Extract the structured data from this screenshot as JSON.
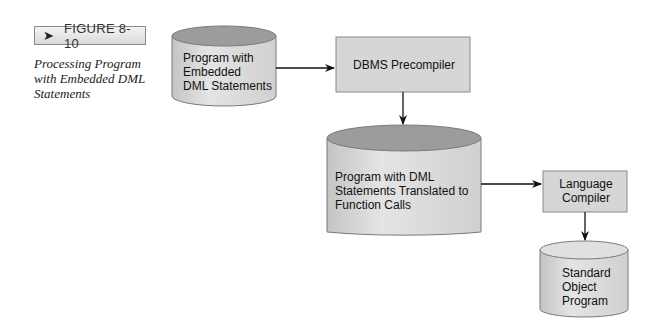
{
  "figure": {
    "tag_icon": "arrow-right-icon",
    "tag_label": "FIGURE 8-10",
    "caption": "Processing Program with Embedded DML Statements"
  },
  "nodes": {
    "source_program": {
      "type": "cylinder",
      "lines": [
        "Program with",
        "Embedded",
        "DML Statements"
      ]
    },
    "precompiler": {
      "type": "process-box",
      "label": "DBMS Precompiler"
    },
    "translated_program": {
      "type": "cylinder",
      "lines": [
        "Program with DML",
        "Statements Translated to",
        "Function Calls"
      ]
    },
    "compiler": {
      "type": "process-box",
      "lines": [
        "Language",
        "Compiler"
      ]
    },
    "object_program": {
      "type": "cylinder",
      "lines": [
        "Standard",
        "Object",
        "Program"
      ]
    }
  },
  "edges": [
    {
      "from": "source_program",
      "to": "precompiler"
    },
    {
      "from": "precompiler",
      "to": "translated_program"
    },
    {
      "from": "translated_program",
      "to": "compiler"
    },
    {
      "from": "compiler",
      "to": "object_program"
    }
  ],
  "colors": {
    "cylinder_top": "#9c9c9c",
    "cylinder_body": "#dcdcdc",
    "box_fill": "#d6d6d6",
    "outline": "#7a7a7a",
    "arrow": "#111111"
  }
}
